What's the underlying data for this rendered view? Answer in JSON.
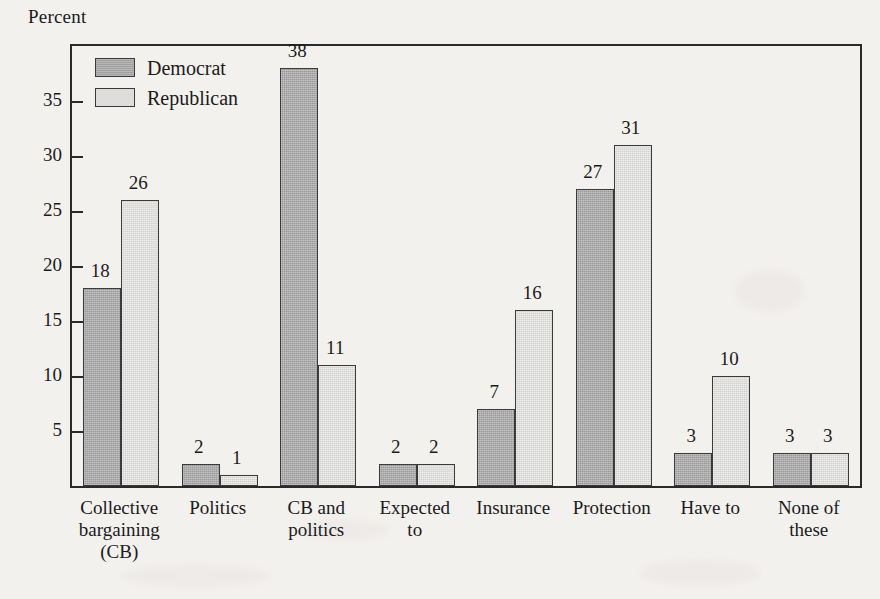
{
  "chart_data": {
    "type": "bar",
    "title": "",
    "subtitle": "",
    "xlabel": "",
    "ylabel": "Percent",
    "ylim": [
      0,
      40
    ],
    "yticks": [
      5,
      10,
      15,
      20,
      25,
      30,
      35
    ],
    "ytick_labels": [
      "5",
      "10",
      "15",
      "20",
      "25",
      "30",
      "35"
    ],
    "grid": false,
    "legend_position": "top-left-inside",
    "categories": [
      "Collective\nbargaining\n(CB)",
      "Politics",
      "CB and\npolitics",
      "Expected\nto",
      "Insurance",
      "Protection",
      "Have to",
      "None of\nthese"
    ],
    "series": [
      {
        "name": "Democrat",
        "color": "#a9a9a9",
        "values": [
          18,
          2,
          38,
          2,
          7,
          27,
          3,
          3
        ],
        "value_labels": [
          "18",
          "2",
          "38",
          "2",
          "7",
          "27",
          "3",
          "3"
        ]
      },
      {
        "name": "Republican",
        "color": "#dddddb",
        "values": [
          26,
          1,
          11,
          2,
          16,
          31,
          10,
          3
        ],
        "value_labels": [
          "26",
          "1",
          "11",
          "2",
          "16",
          "31",
          "10",
          "3"
        ]
      }
    ]
  },
  "legend": {
    "items": [
      {
        "label": "Democrat",
        "swatch": "democrat-swatch"
      },
      {
        "label": "Republican",
        "swatch": "republican-swatch"
      }
    ]
  },
  "axis": {
    "y_title": "Percent"
  },
  "colors": {
    "background": "#f3f1ee",
    "frame": "#2a2a2a",
    "democrat": "#a9a9a9",
    "republican": "#dddddb",
    "text": "#1b1b1b"
  }
}
